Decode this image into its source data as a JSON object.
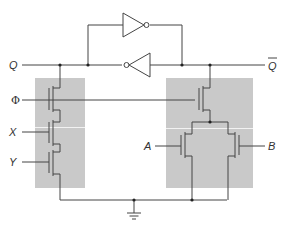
{
  "diagram": {
    "type": "circuit-schematic",
    "colors": {
      "wire": "#444444",
      "shade": "#c9c9c9",
      "background": "#ffffff"
    },
    "labels": {
      "q": "Q",
      "q_bar": "Q",
      "phi": "Φ",
      "x": "X",
      "y": "Y",
      "a": "A",
      "b": "B"
    },
    "components": {
      "inverters": [
        "upper inverter (right-pointing)",
        "lower inverter (left-pointing)"
      ],
      "left_network": [
        "phi-gated transistor",
        "X-gated transistor",
        "Y-gated transistor"
      ],
      "right_network": [
        "phi-gated transistor",
        "A-gated transistor",
        "B-gated transistor"
      ],
      "ground": "ground symbol"
    }
  }
}
